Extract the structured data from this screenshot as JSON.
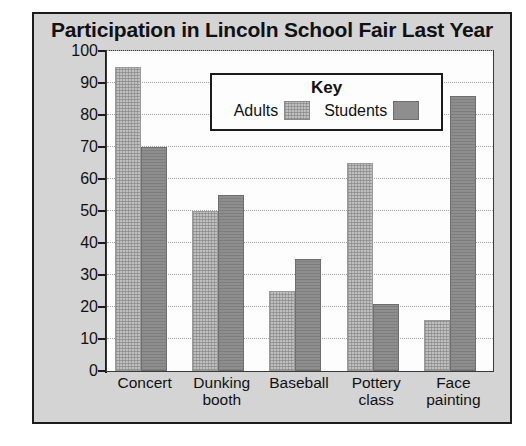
{
  "chart_data": {
    "type": "bar",
    "title": "Participation in Lincoln School Fair Last Year",
    "xlabel": "",
    "ylabel": "",
    "ylim": [
      0,
      100
    ],
    "yticks": [
      0,
      10,
      20,
      30,
      40,
      50,
      60,
      70,
      80,
      90,
      100
    ],
    "ytick_labels": [
      "0",
      "10",
      "20",
      "30",
      "40",
      "50",
      "60",
      "70",
      "80",
      "90",
      "100"
    ],
    "grid": true,
    "legend_position": "inside-top-center",
    "legend_title": "Key",
    "categories": [
      "Concert",
      "Dunking booth",
      "Baseball",
      "Pottery class",
      "Face painting"
    ],
    "category_lines": [
      [
        "Concert"
      ],
      [
        "Dunking",
        "booth"
      ],
      [
        "Baseball"
      ],
      [
        "Pottery",
        "class"
      ],
      [
        "Face",
        "painting"
      ]
    ],
    "series": [
      {
        "name": "Adults",
        "color": "#bfbfbf",
        "values": [
          95,
          50,
          25,
          65,
          16
        ]
      },
      {
        "name": "Students",
        "color": "#8e8e8e",
        "values": [
          70,
          55,
          35,
          21,
          86
        ]
      }
    ]
  },
  "colors": {
    "panel_background": "#d4d4d4",
    "plot_background": "#fdfdfd",
    "frame_border": "#1c1c1c",
    "axis": "#1c1c1c",
    "gridline": "#a9a9a9",
    "adults_bar": "#bfbfbf",
    "students_bar": "#8e8e8e",
    "text": "#111111"
  }
}
